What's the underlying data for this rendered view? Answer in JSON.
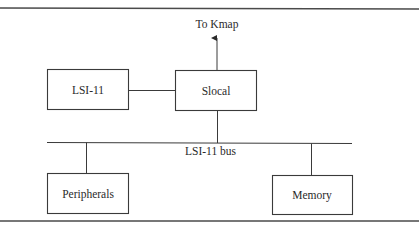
{
  "diagram": {
    "external_label": "To Kmap",
    "bus_label": "LSI-11 bus",
    "nodes": [
      {
        "id": "lsi11",
        "label": "LSI-11"
      },
      {
        "id": "slocal",
        "label": "Slocal"
      },
      {
        "id": "peripherals",
        "label": "Peripherals"
      },
      {
        "id": "memory",
        "label": "Memory"
      }
    ],
    "edges": [
      {
        "from": "lsi11",
        "to": "slocal"
      },
      {
        "from": "slocal",
        "to": "kmap",
        "directed": true
      },
      {
        "from": "slocal",
        "to": "lsi11-bus"
      },
      {
        "from": "peripherals",
        "to": "lsi11-bus"
      },
      {
        "from": "memory",
        "to": "lsi11-bus"
      }
    ]
  }
}
